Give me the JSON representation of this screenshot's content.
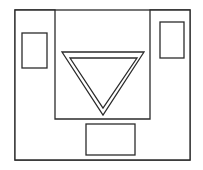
{
  "figure": {
    "background_color": "#ffffff",
    "stroke_color": "#2b2b2b",
    "canvas": {
      "width": 203,
      "height": 170
    },
    "shapes": {
      "outer_frame": {
        "name": "outer-frame-rectangle",
        "type": "rectangle",
        "x": 15,
        "y": 10,
        "width": 175,
        "height": 150,
        "stroke_width": 1.3
      },
      "notched_block": {
        "name": "u-shaped-block",
        "type": "polygon",
        "description": "U-shaped polygon with rectangular notch cut from top center",
        "points": "15,10 55,10 55,119 150,119 150,10 190,10 190,160 15,160",
        "stroke_width": 1.3
      },
      "left_inner_rect": {
        "name": "left-arm-inner-rectangle",
        "type": "rectangle",
        "x": 22,
        "y": 33,
        "width": 25,
        "height": 35,
        "stroke_width": 1.3
      },
      "right_inner_rect": {
        "name": "right-arm-inner-rectangle",
        "type": "rectangle",
        "x": 160,
        "y": 22,
        "width": 24,
        "height": 36,
        "stroke_width": 1.3
      },
      "bottom_rect": {
        "name": "bottom-center-rectangle",
        "type": "rectangle",
        "x": 86,
        "y": 124,
        "width": 49,
        "height": 31,
        "stroke_width": 1.3
      },
      "outer_triangle": {
        "name": "outer-down-triangle",
        "type": "triangle",
        "orientation": "point-down",
        "points": "62,52 144,52 103,115",
        "stroke_width": 1.3
      },
      "inner_triangle": {
        "name": "inner-down-triangle",
        "type": "triangle",
        "orientation": "point-down",
        "points": "70,58 137,58 103,108",
        "stroke_width": 1.3
      }
    }
  }
}
